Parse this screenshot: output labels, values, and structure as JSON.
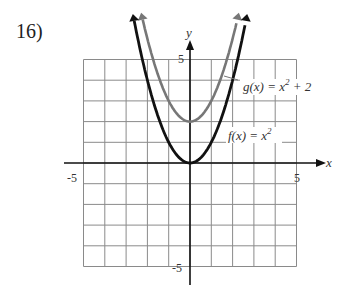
{
  "problem_number": "16)",
  "chart_data": {
    "type": "line",
    "title": "",
    "xlabel": "x",
    "ylabel": "y",
    "xlim": [
      -5,
      5
    ],
    "ylim": [
      -5,
      5
    ],
    "grid": true,
    "tick_labels": {
      "x": [
        "-5",
        "5"
      ],
      "y": [
        "5",
        "-5"
      ]
    },
    "series": [
      {
        "name": "f(x) = x^2",
        "label": "f(x) = x",
        "sup": "2",
        "color": "#111111",
        "function": "x^2",
        "x": [
          -2.6,
          -2,
          -1,
          0,
          1,
          2,
          2.6
        ],
        "values": [
          6.76,
          4,
          1,
          0,
          1,
          4,
          6.76
        ]
      },
      {
        "name": "g(x) = x^2 + 2",
        "label": "g(x) = x",
        "sup": "2",
        "tail": " + 2",
        "color": "#777777",
        "function": "x^2+2",
        "x": [
          -2.2,
          -2,
          -1,
          0,
          1,
          2,
          2.2
        ],
        "values": [
          6.84,
          6,
          3,
          2,
          3,
          6,
          6.84
        ]
      }
    ]
  }
}
